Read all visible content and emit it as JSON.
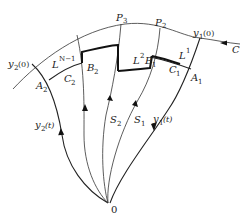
{
  "figure": {
    "type": "phase-plane trajectory diagram",
    "labels": {
      "y2_0": {
        "base": "y",
        "sub": "2",
        "tail": "(0)"
      },
      "y1_0": {
        "base": "y",
        "sub": "1",
        "tail": "(0)"
      },
      "P3": {
        "base": "P",
        "sub": "3"
      },
      "P2": {
        "base": "P",
        "sub": "2"
      },
      "C": {
        "base": "C"
      },
      "LN1": {
        "base": "L",
        "sup": "N−1"
      },
      "L2": {
        "base": "L",
        "sup": "2"
      },
      "L1": {
        "base": "L",
        "sup": "1"
      },
      "B2": {
        "base": "B",
        "sub": "2"
      },
      "B1": {
        "base": "B",
        "sub": "1"
      },
      "C2": {
        "base": "C",
        "sub": "2"
      },
      "C1": {
        "base": "C",
        "sub": "1"
      },
      "A2": {
        "base": "A",
        "sub": "2"
      },
      "A1": {
        "base": "A",
        "sub": "1"
      },
      "S2": {
        "base": "S",
        "sub": "2"
      },
      "S1": {
        "base": "S",
        "sub": "1"
      },
      "y2_t": {
        "base": "y",
        "sub": "2",
        "tail": "(t)"
      },
      "y1_t": {
        "base": "y",
        "sub": "1",
        "tail": "(t)"
      },
      "origin": {
        "base": "0"
      }
    }
  }
}
